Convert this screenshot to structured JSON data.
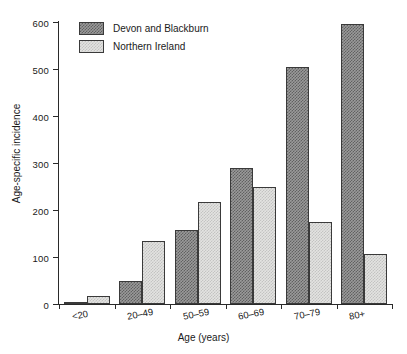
{
  "chart_data": {
    "type": "bar",
    "title": "",
    "xlabel": "Age (years)",
    "ylabel": "Age-specific incidence",
    "categories": [
      "<20",
      "20–49",
      "50–59",
      "60–69",
      "70–79",
      "80+"
    ],
    "series": [
      {
        "name": "Devon and Blackburn",
        "color": "#9a9a9a",
        "values": [
          3,
          50,
          158,
          290,
          505,
          595
        ]
      },
      {
        "name": "Northern Ireland",
        "color": "#e3e3e1",
        "values": [
          18,
          135,
          218,
          248,
          174,
          107
        ]
      }
    ],
    "ylim": [
      0,
      600
    ],
    "yticks": [
      0,
      100,
      200,
      300,
      400,
      500,
      600
    ],
    "ytick_labels": [
      "0",
      "100",
      "200",
      "300",
      "400",
      "500",
      "600"
    ],
    "grid": false,
    "legend_position": "top-left"
  }
}
